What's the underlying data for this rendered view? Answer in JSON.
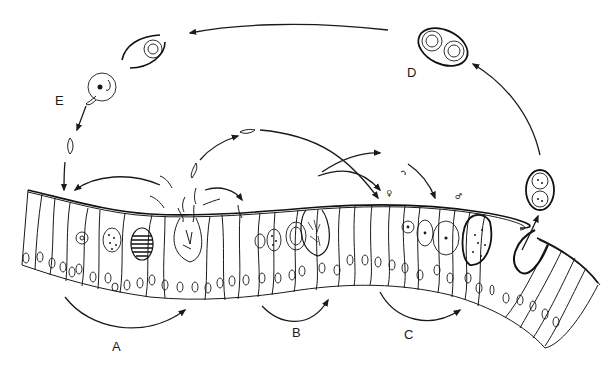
{
  "figure": {
    "type": "life-cycle-diagram",
    "stage_labels": [
      {
        "id": "A",
        "text": "A",
        "x": 116,
        "y": 345
      },
      {
        "id": "B",
        "text": "B",
        "x": 296,
        "y": 331
      },
      {
        "id": "C",
        "text": "C",
        "x": 408,
        "y": 333
      },
      {
        "id": "D",
        "text": "D",
        "x": 411,
        "y": 71
      },
      {
        "id": "E",
        "text": "E",
        "x": 59,
        "y": 99
      }
    ],
    "sex_symbols": [
      {
        "id": "female",
        "text": "♀",
        "x": 385,
        "y": 195
      },
      {
        "id": "male",
        "text": "♂",
        "x": 456,
        "y": 198
      }
    ],
    "stages": {
      "A": "first merogony cycle",
      "B": "second merogony cycle",
      "C": "gametogony",
      "D": "sporulated oocyst with two sporocysts",
      "E": "excystation releasing sporozoite"
    },
    "colors": {
      "ink": "#1a1a1a",
      "background": "#ffffff"
    }
  }
}
